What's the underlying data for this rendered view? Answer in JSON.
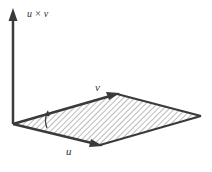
{
  "diagram": {
    "labels": {
      "cross": "u × v",
      "v": "v",
      "u": "u"
    },
    "colors": {
      "stroke": "#3a3a3a",
      "hatch": "#777777",
      "background": "#ffffff"
    },
    "points": {
      "origin": [
        13,
        124
      ],
      "u_end": [
        100,
        145
      ],
      "v_end": [
        117,
        94
      ],
      "far_vertex": [
        201,
        116
      ],
      "cross_tip": [
        14,
        9
      ]
    }
  }
}
